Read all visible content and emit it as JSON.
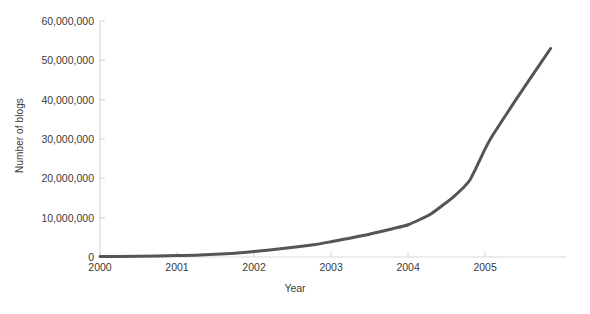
{
  "chart_data": {
    "type": "line",
    "title": "",
    "xlabel": "Year",
    "ylabel": "Number of blogs",
    "xlim": [
      2000,
      2006.05
    ],
    "ylim": [
      0,
      60000000
    ],
    "grid": false,
    "legend": null,
    "line_color": "#555555",
    "axis_color": "#d9d9d9",
    "x_ticks": [
      2000,
      2001,
      2002,
      2003,
      2004,
      2005
    ],
    "x_tick_labels": [
      "2000",
      "2001",
      "2002",
      "2003",
      "2004",
      "2005"
    ],
    "y_ticks": [
      0,
      10000000,
      20000000,
      30000000,
      40000000,
      50000000,
      60000000
    ],
    "y_tick_labels": [
      "0",
      "10,000,000",
      "20,000,000",
      "30,000,000",
      "40,000,000",
      "50,000,000",
      "60,000,000"
    ],
    "series": [
      {
        "name": "Number of blogs",
        "x": [
          2000.0,
          2000.5,
          2001.0,
          2001.3,
          2001.7,
          2002.0,
          2002.4,
          2002.8,
          2003.0,
          2003.4,
          2003.8,
          2004.0,
          2004.3,
          2004.6,
          2004.8,
          2005.0,
          2005.1,
          2005.4,
          2005.85
        ],
        "values": [
          100000,
          200000,
          350000,
          500000,
          900000,
          1400000,
          2200000,
          3200000,
          3900000,
          5400000,
          7200000,
          8200000,
          11000000,
          15500000,
          19500000,
          27500000,
          31000000,
          40000000,
          53000000
        ]
      }
    ]
  }
}
